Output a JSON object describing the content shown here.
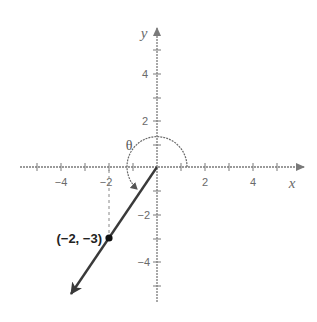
{
  "diagram": {
    "type": "coordinate-plane",
    "axes": {
      "x_label": "x",
      "y_label": "y",
      "x_range": [
        -5,
        5
      ],
      "y_range": [
        -5,
        5
      ],
      "x_tick_labels": [
        "−4",
        "−2",
        "2",
        "4"
      ],
      "y_tick_labels": [
        "4",
        "2",
        "−2",
        "−4"
      ]
    },
    "point": {
      "x": -2,
      "y": -3,
      "label": "(−2, −3)"
    },
    "ray": {
      "from": [
        0,
        0
      ],
      "through": [
        -2,
        -3
      ],
      "direction": "outward arrow into quadrant III"
    },
    "angle": {
      "label": "θ",
      "description": "arc from positive x-axis counterclockwise to the ray"
    },
    "colors": {
      "axis": "#7a7a7a",
      "ray": "#3a3a3a",
      "point": "#111111",
      "arc": "#6a6a6a"
    }
  }
}
